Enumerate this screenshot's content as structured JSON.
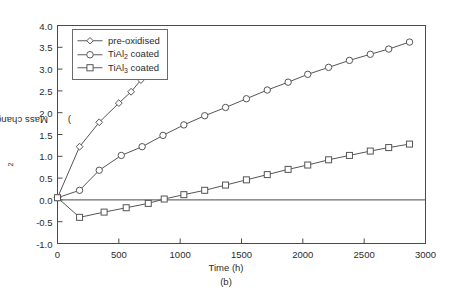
{
  "figure": {
    "caption": "(b)",
    "axis_color": "#4a4a4a",
    "series_color": "#555555"
  },
  "axes": {
    "xlabel": "Time (h)",
    "ylabel_text": "Mass change (mg/cm",
    "ylabel_sup": "2",
    "ylabel_tail": ")",
    "xticks": [
      "0",
      "500",
      "1000",
      "1500",
      "2000",
      "2500",
      "3000"
    ],
    "yticks": [
      "4.0",
      "3.5",
      "3.0",
      "2.5",
      "2.0",
      "1.5",
      "1.0",
      "0.5",
      "0.0",
      "-0.5",
      "-1.0"
    ]
  },
  "legend": {
    "items": [
      {
        "label_pre": "pre-oxidised",
        "label_sub": "",
        "label_post": "",
        "marker": "diamond-marker"
      },
      {
        "label_pre": "TiAl",
        "label_sub": "2",
        "label_post": " coated",
        "marker": "circle-marker"
      },
      {
        "label_pre": "TiAl",
        "label_sub": "3",
        "label_post": " coated",
        "marker": "square-marker"
      }
    ]
  },
  "chart_data": {
    "type": "line",
    "title": "",
    "xlabel": "Time (h)",
    "ylabel": "Mass change (mg/cm2)",
    "xlim": [
      0,
      3000
    ],
    "ylim": [
      -1.0,
      4.0
    ],
    "xticks": [
      0,
      500,
      1000,
      1500,
      2000,
      2500,
      3000
    ],
    "yticks": [
      -1.0,
      -0.5,
      0.0,
      0.5,
      1.0,
      1.5,
      2.0,
      2.5,
      3.0,
      3.5,
      4.0
    ],
    "grid": false,
    "legend_position": "upper-left",
    "zero_line": true,
    "series": [
      {
        "name": "pre-oxidised",
        "marker": "diamond",
        "points": [
          [
            0,
            0.05
          ],
          [
            180,
            1.22
          ],
          [
            340,
            1.78
          ],
          [
            500,
            2.22
          ],
          [
            600,
            2.48
          ],
          [
            680,
            2.75
          ]
        ]
      },
      {
        "name": "TiAl2 coated",
        "marker": "circle",
        "points": [
          [
            0,
            0.05
          ],
          [
            180,
            0.22
          ],
          [
            340,
            0.68
          ],
          [
            520,
            1.02
          ],
          [
            690,
            1.22
          ],
          [
            860,
            1.48
          ],
          [
            1030,
            1.72
          ],
          [
            1200,
            1.93
          ],
          [
            1370,
            2.12
          ],
          [
            1540,
            2.32
          ],
          [
            1710,
            2.52
          ],
          [
            1880,
            2.7
          ],
          [
            2040,
            2.88
          ],
          [
            2210,
            3.04
          ],
          [
            2380,
            3.2
          ],
          [
            2550,
            3.34
          ],
          [
            2700,
            3.46
          ],
          [
            2870,
            3.62
          ]
        ]
      },
      {
        "name": "TiAl3 coated",
        "marker": "square",
        "points": [
          [
            0,
            0.05
          ],
          [
            180,
            -0.4
          ],
          [
            380,
            -0.28
          ],
          [
            560,
            -0.18
          ],
          [
            740,
            -0.08
          ],
          [
            870,
            0.02
          ],
          [
            1030,
            0.12
          ],
          [
            1200,
            0.22
          ],
          [
            1370,
            0.34
          ],
          [
            1540,
            0.46
          ],
          [
            1710,
            0.58
          ],
          [
            1880,
            0.7
          ],
          [
            2040,
            0.8
          ],
          [
            2210,
            0.92
          ],
          [
            2380,
            1.02
          ],
          [
            2550,
            1.12
          ],
          [
            2700,
            1.2
          ],
          [
            2870,
            1.28
          ]
        ]
      }
    ]
  }
}
